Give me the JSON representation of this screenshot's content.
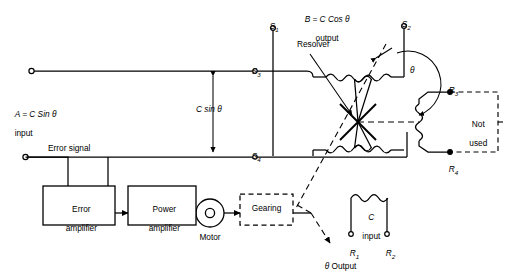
{
  "diagram": {
    "background": "#ffffff",
    "line_color": "#000000"
  },
  "labels": {
    "input_a": "A = C Sin θ",
    "input_a_line2": "input",
    "output_b": "B = C Cos θ",
    "output_b_line2": "output",
    "resolver": "Resolver",
    "c_sin_theta": "C sin θ",
    "error_signal": "Error signal",
    "not_used_line1": "Not",
    "not_used_line2": "used",
    "motor": "Motor",
    "c_input_line1": "C",
    "c_input_line2": "input",
    "theta_output": "θ Output",
    "theta_angle": "θ"
  },
  "blocks": [
    {
      "id": "error-amplifier",
      "line1": "Error",
      "line2": "amplifier",
      "style": "solid"
    },
    {
      "id": "power-amplifier",
      "line1": "Power",
      "line2": "amplifier",
      "style": "solid"
    },
    {
      "id": "gearing",
      "line1": "Gearing",
      "line2": "",
      "style": "dashed"
    }
  ],
  "terminals": [
    {
      "id": "S1",
      "letter": "S",
      "index": "1"
    },
    {
      "id": "S2",
      "letter": "S",
      "index": "2"
    },
    {
      "id": "S3",
      "letter": "S",
      "index": "3"
    },
    {
      "id": "S4",
      "letter": "S",
      "index": "4"
    },
    {
      "id": "R1",
      "letter": "R",
      "index": "1"
    },
    {
      "id": "R2",
      "letter": "R",
      "index": "2"
    },
    {
      "id": "R3",
      "letter": "R",
      "index": "3"
    },
    {
      "id": "R4",
      "letter": "R",
      "index": "4"
    }
  ]
}
